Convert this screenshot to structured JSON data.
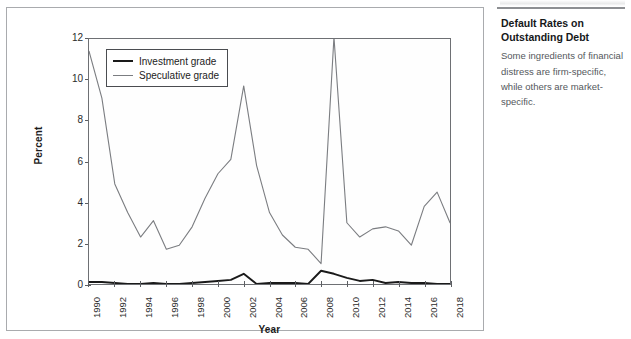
{
  "figure": {
    "panel_border_color": "#a9abae",
    "background": "#ffffff"
  },
  "caption": {
    "title": "Default Rates on Outstanding Debt",
    "body": "Some ingredients of financial distress are firm-specific, while others are market-specific."
  },
  "legend": {
    "items": [
      {
        "label": "Investment grade",
        "color": "#1a1a1a"
      },
      {
        "label": "Speculative grade",
        "color": "#7b7d81"
      }
    ]
  },
  "chart_data": {
    "type": "line",
    "title": "",
    "xlabel": "Year",
    "ylabel": "Percent",
    "xlim": [
      1990,
      2018
    ],
    "ylim": [
      0,
      12
    ],
    "yticks": [
      0,
      2,
      4,
      6,
      8,
      10,
      12
    ],
    "ytick_labels": [
      "0",
      "2",
      "4",
      "6",
      "8",
      "10",
      "12"
    ],
    "xticks": [
      1990,
      1992,
      1994,
      1996,
      1998,
      2000,
      2002,
      2004,
      2006,
      2008,
      2010,
      2012,
      2014,
      2016,
      2018
    ],
    "xtick_labels": [
      "1990",
      "1992",
      "1994",
      "1996",
      "1998",
      "2000",
      "2002",
      "2004",
      "2006",
      "2008",
      "2010",
      "2012",
      "2014",
      "2016",
      "2018"
    ],
    "grid": false,
    "legend_position": "upper-left-inside",
    "x": [
      1990,
      1991,
      1992,
      1993,
      1994,
      1995,
      1996,
      1997,
      1998,
      1999,
      2000,
      2001,
      2002,
      2003,
      2004,
      2005,
      2006,
      2007,
      2008,
      2009,
      2010,
      2011,
      2012,
      2013,
      2014,
      2015,
      2016,
      2017,
      2018
    ],
    "series": [
      {
        "name": "Speculative grade",
        "color": "#7b7d81",
        "values": [
          11.4,
          9.1,
          4.9,
          3.5,
          2.3,
          3.1,
          1.7,
          1.9,
          2.8,
          4.2,
          5.4,
          6.1,
          9.7,
          5.8,
          3.5,
          2.4,
          1.8,
          1.7,
          1.0,
          12.1,
          3.0,
          2.3,
          2.7,
          2.8,
          2.6,
          1.9,
          3.8,
          4.5,
          3.0
        ]
      },
      {
        "name": "Investment grade",
        "color": "#1a1a1a",
        "values": [
          0.1,
          0.1,
          0.05,
          0.0,
          0.0,
          0.05,
          0.0,
          0.0,
          0.05,
          0.1,
          0.15,
          0.2,
          0.5,
          0.0,
          0.05,
          0.05,
          0.05,
          0.0,
          0.65,
          0.5,
          0.3,
          0.15,
          0.2,
          0.05,
          0.1,
          0.05,
          0.05,
          0.0,
          0.0
        ]
      }
    ]
  }
}
